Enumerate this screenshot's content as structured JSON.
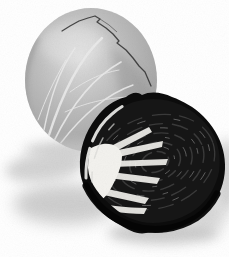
{
  "image": {
    "description": "Black-and-white product photograph of a whole cabbage behind a halved cabbage; the cut cross-section is very dark with a white core and pale veins radiating across the face; soft shadows fall to the lower left and beneath the halved cabbage.",
    "objects": {
      "whole_cabbage": "whole cabbage head with pale radiating leaf veins and a dark crack along the top leaf edge",
      "halved_cabbage": "halved cabbage showing dark swirled cross-section",
      "core": "white wedge-shaped core with light streaks fanning outward",
      "shadow": "soft gray drop shadows on white background"
    },
    "palette": {
      "background": "#ffffff",
      "cabbage_gray": "#b6b6b6",
      "cabbage_highlight": "#e0e0e0",
      "cabbage_edge": "#8d8d8d",
      "crack": "#2f2f2f",
      "vein": "#eaeaea",
      "halved_dark": "#0c0c0c",
      "swirl": "#3a3a3a",
      "glint": "#8f8f8f",
      "core_white": "#f3f2ee",
      "rim_light": "#e8e8e6",
      "shadow": "#c6c6c6"
    }
  }
}
